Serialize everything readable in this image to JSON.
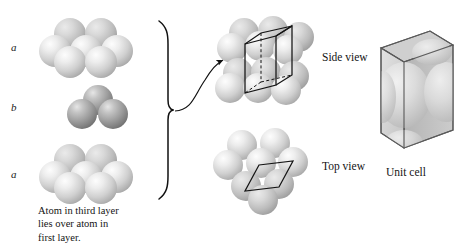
{
  "figure": {
    "topic": "hexagonal-close-packed-structure",
    "layer_labels": [
      {
        "text": "a",
        "x": 13,
        "y": 38
      },
      {
        "text": "b",
        "x": 13,
        "y": 107
      },
      {
        "text": "a",
        "x": 13,
        "y": 172
      }
    ],
    "view_labels": [
      {
        "name": "side-view",
        "text": "Side view",
        "x": 322,
        "y": 57
      },
      {
        "name": "top-view",
        "text": "Top view",
        "x": 322,
        "y": 166
      },
      {
        "name": "unit-cell",
        "text": "Unit cell",
        "x": 386,
        "y": 172
      }
    ],
    "caption": {
      "lines": [
        "Atom in third layer",
        "lies over atom in",
        "first layer."
      ],
      "x": 38,
      "y": 206
    },
    "colors": {
      "sphere_light_core": "#f4f4f4",
      "sphere_light_mid": "#d2d2d2",
      "sphere_light_edge": "#9d9d9d",
      "sphere_dark_core": "#d8d8d8",
      "sphere_dark_mid": "#a2a2a2",
      "sphere_dark_edge": "#6e6e6e",
      "outline": "#1a1a1a",
      "cell_face_front": "#d8d8d8",
      "cell_face_side": "#b8b8b8",
      "cell_face_top": "#cfcfcf",
      "background": "#ffffff"
    },
    "stacks": {
      "layer_a_top": {
        "cx": 88,
        "cy": 47,
        "spheres": 7,
        "shade": "light"
      },
      "layer_b_mid": {
        "cx": 88,
        "cy": 110,
        "spheres": 3,
        "shade": "dark"
      },
      "layer_a_bottom": {
        "cx": 88,
        "cy": 173,
        "spheres": 7,
        "shade": "light"
      },
      "side_view_cluster": {
        "cx": 263,
        "cy": 62,
        "shade": "light"
      },
      "top_view_cluster": {
        "cx": 263,
        "cy": 172,
        "shade": "light"
      },
      "unit_cell_box": {
        "cx": 410,
        "cy": 90
      }
    },
    "brace": {
      "x": 168,
      "y_top": 20,
      "y_bottom": 200
    },
    "arrow": {
      "x_start": 172,
      "y_start": 110,
      "x_end": 224,
      "y_end": 59
    }
  }
}
